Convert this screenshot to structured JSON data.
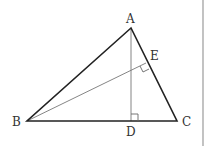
{
  "diagram": {
    "type": "geometry-triangle",
    "points": {
      "A": {
        "label": "A",
        "x": 131,
        "y": 28
      },
      "B": {
        "label": "B",
        "x": 27,
        "y": 121
      },
      "C": {
        "label": "C",
        "x": 177,
        "y": 121
      },
      "D": {
        "label": "D",
        "x": 131,
        "y": 121
      },
      "E": {
        "label": "E",
        "x": 146,
        "y": 63
      }
    },
    "segments": [
      {
        "from": "A",
        "to": "B",
        "style": "thick"
      },
      {
        "from": "A",
        "to": "C",
        "style": "thick"
      },
      {
        "from": "B",
        "to": "C",
        "style": "thick"
      },
      {
        "from": "A",
        "to": "D",
        "style": "thin",
        "note": "altitude AD ⊥ BC"
      },
      {
        "from": "B",
        "to": "E",
        "style": "thin",
        "note": "altitude BE ⊥ AC"
      }
    ],
    "right_angles": [
      "D",
      "E"
    ],
    "colors": {
      "main_line": "#222222",
      "thin_line": "#777777",
      "border": "#999999"
    }
  }
}
